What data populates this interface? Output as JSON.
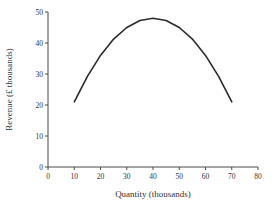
{
  "page": {
    "background": "#ffffff"
  },
  "chart_data": {
    "type": "line",
    "title": "",
    "xlabel": "Quantity (thousands)",
    "ylabel": "Revenue (£ thousands)",
    "x": [
      10,
      15,
      20,
      25,
      30,
      35,
      40,
      45,
      50,
      55,
      60,
      65,
      70
    ],
    "y": [
      21,
      29.25,
      36,
      41.25,
      45,
      47.25,
      48,
      47.25,
      45,
      41.25,
      36,
      29.25,
      21
    ],
    "xlim": [
      0,
      80
    ],
    "ylim": [
      0,
      50
    ],
    "xticks": [
      0,
      10,
      20,
      30,
      40,
      50,
      60,
      70,
      80
    ],
    "yticks": [
      0,
      10,
      20,
      30,
      40,
      50
    ],
    "grid": false,
    "legend": null,
    "line_color": "#2b2b2b",
    "axis_color": "#4a4a4a",
    "text_color": "#333333"
  }
}
